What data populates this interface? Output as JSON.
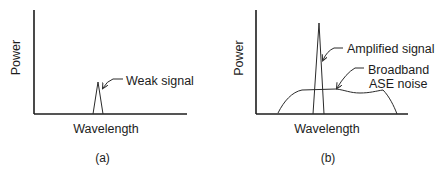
{
  "panels": [
    {
      "id": "a",
      "caption": "(a)",
      "xlabel": "Wavelength",
      "ylabel": "Power",
      "annotations": [
        {
          "text": "Weak signal"
        }
      ]
    },
    {
      "id": "b",
      "caption": "(b)",
      "xlabel": "Wavelength",
      "ylabel": "Power",
      "annotations": [
        {
          "text": "Amplified signal"
        },
        {
          "text": "Broadband"
        },
        {
          "text": "ASE noise"
        }
      ]
    }
  ],
  "colors": {
    "line": "#1c1c1c",
    "background": "#ffffff"
  }
}
